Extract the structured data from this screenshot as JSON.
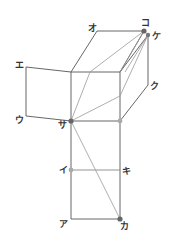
{
  "diagram": {
    "type": "cube-net-with-folding",
    "labels": {
      "a": "ア",
      "i": "イ",
      "u": "ウ",
      "e": "エ",
      "o": "オ",
      "ka": "カ",
      "ki": "キ",
      "ku": "ク",
      "ke": "ケ",
      "ko": "コ",
      "sa": "サ"
    },
    "colors": {
      "edge": "#555555",
      "diagonal": "#999999",
      "dot_dark": "#666666",
      "dot_light": "#aaaaaa",
      "background": "#ffffff"
    }
  }
}
